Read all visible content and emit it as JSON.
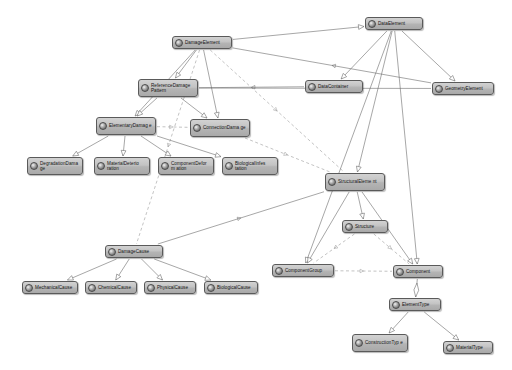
{
  "diagram": {
    "type": "uml-class-diagram",
    "background": "#ffffff",
    "node_fill": "#c3c3c3",
    "node_border": "#5a5a5a",
    "edge_color": "#6b6b6b",
    "dashed_edge_color": "#9a9a9a",
    "nodes": [
      {
        "id": "damageElement",
        "label": "DamageElement",
        "x": 172,
        "y": 36,
        "w": 60,
        "h": 13
      },
      {
        "id": "dataElement",
        "label": "DataElement",
        "x": 365,
        "y": 17,
        "w": 58,
        "h": 13
      },
      {
        "id": "referenceDamagePattern",
        "label": "ReferenceDamage Pattern",
        "x": 138,
        "y": 79,
        "w": 60,
        "h": 18
      },
      {
        "id": "dataContainer",
        "label": "DataContainer",
        "x": 305,
        "y": 80,
        "w": 58,
        "h": 13
      },
      {
        "id": "geometryElement",
        "label": "GeometryElement",
        "x": 432,
        "y": 82,
        "w": 62,
        "h": 13
      },
      {
        "id": "elementaryDamage",
        "label": "ElementaryDamag e",
        "x": 96,
        "y": 117,
        "w": 60,
        "h": 18
      },
      {
        "id": "connectionDamage",
        "label": "ConnectionDama ge",
        "x": 190,
        "y": 119,
        "w": 60,
        "h": 18
      },
      {
        "id": "degradationDamage",
        "label": "DegradationDama ge",
        "x": 27,
        "y": 157,
        "w": 56,
        "h": 18
      },
      {
        "id": "materialDeterioration",
        "label": "MaterialDeterio ration",
        "x": 94,
        "y": 157,
        "w": 56,
        "h": 18
      },
      {
        "id": "componentDeformation",
        "label": "ComponentDeform ation",
        "x": 158,
        "y": 157,
        "w": 56,
        "h": 18
      },
      {
        "id": "biologicalInfestation",
        "label": "BiologicalInfes tation",
        "x": 222,
        "y": 157,
        "w": 56,
        "h": 18
      },
      {
        "id": "structuralElement",
        "label": "StructuralEleme nt",
        "x": 325,
        "y": 173,
        "w": 60,
        "h": 18
      },
      {
        "id": "structure",
        "label": "Structure",
        "x": 342,
        "y": 220,
        "w": 46,
        "h": 13
      },
      {
        "id": "damageCause",
        "label": "DamageCause",
        "x": 105,
        "y": 245,
        "w": 58,
        "h": 13
      },
      {
        "id": "componentGroup",
        "label": "ComponentGroup",
        "x": 272,
        "y": 264,
        "w": 62,
        "h": 13
      },
      {
        "id": "component",
        "label": "Component",
        "x": 393,
        "y": 265,
        "w": 50,
        "h": 13
      },
      {
        "id": "mechanicalCause",
        "label": "MechanicalCause",
        "x": 22,
        "y": 281,
        "w": 56,
        "h": 13
      },
      {
        "id": "chemicalCause",
        "label": "ChemicalCause",
        "x": 85,
        "y": 281,
        "w": 52,
        "h": 13
      },
      {
        "id": "physicalCause",
        "label": "PhysicalCause",
        "x": 144,
        "y": 281,
        "w": 52,
        "h": 13
      },
      {
        "id": "biologicalCause",
        "label": "BiologicalCause",
        "x": 204,
        "y": 281,
        "w": 54,
        "h": 13
      },
      {
        "id": "elementType",
        "label": "ElementType",
        "x": 389,
        "y": 298,
        "w": 52,
        "h": 13
      },
      {
        "id": "constructionType",
        "label": "ConstructionTyp e",
        "x": 352,
        "y": 334,
        "w": 56,
        "h": 18
      },
      {
        "id": "materialType",
        "label": "MaterialType",
        "x": 443,
        "y": 341,
        "w": 50,
        "h": 13
      }
    ],
    "edges": [
      {
        "from": "damageElement",
        "to": "referenceDamagePattern",
        "style": "solid",
        "arrow": "hollow"
      },
      {
        "from": "damageElement",
        "to": "elementaryDamage",
        "style": "solid",
        "arrow": "hollow"
      },
      {
        "from": "damageElement",
        "to": "connectionDamage",
        "style": "solid",
        "arrow": "hollow"
      },
      {
        "from": "damageElement",
        "to": "dataElement",
        "style": "solid",
        "arrow": "hollow"
      },
      {
        "from": "damageElement",
        "to": "structuralElement",
        "style": "dashed",
        "arrow": "open"
      },
      {
        "from": "damageElement",
        "to": "damageCause",
        "style": "dashed",
        "arrow": "open"
      },
      {
        "from": "dataElement",
        "to": "dataContainer",
        "style": "solid",
        "arrow": "hollow"
      },
      {
        "from": "dataElement",
        "to": "geometryElement",
        "style": "solid",
        "arrow": "hollow"
      },
      {
        "from": "dataElement",
        "to": "structuralElement",
        "style": "solid",
        "arrow": "hollow"
      },
      {
        "from": "dataElement",
        "to": "component",
        "style": "solid",
        "arrow": "hollow"
      },
      {
        "from": "dataElement",
        "to": "componentGroup",
        "style": "solid",
        "arrow": "hollow"
      },
      {
        "from": "dataContainer",
        "to": "referenceDamagePattern",
        "style": "solid",
        "arrow": "open"
      },
      {
        "from": "geometryElement",
        "to": "damageElement",
        "style": "solid",
        "arrow": "open"
      },
      {
        "from": "referenceDamagePattern",
        "to": "elementaryDamage",
        "style": "solid",
        "arrow": "hollow"
      },
      {
        "from": "referenceDamagePattern",
        "to": "connectionDamage",
        "style": "solid",
        "arrow": "hollow"
      },
      {
        "from": "elementaryDamage",
        "to": "connectionDamage",
        "style": "dashed",
        "arrow": "open"
      },
      {
        "from": "elementaryDamage",
        "to": "degradationDamage",
        "style": "solid",
        "arrow": "hollow"
      },
      {
        "from": "elementaryDamage",
        "to": "materialDeterioration",
        "style": "solid",
        "arrow": "hollow"
      },
      {
        "from": "elementaryDamage",
        "to": "componentDeformation",
        "style": "solid",
        "arrow": "hollow"
      },
      {
        "from": "elementaryDamage",
        "to": "biologicalInfestation",
        "style": "solid",
        "arrow": "hollow"
      },
      {
        "from": "structuralElement",
        "to": "structure",
        "style": "solid",
        "arrow": "hollow"
      },
      {
        "from": "structuralElement",
        "to": "componentGroup",
        "style": "solid",
        "arrow": "hollow"
      },
      {
        "from": "structuralElement",
        "to": "component",
        "style": "solid",
        "arrow": "hollow"
      },
      {
        "from": "structure",
        "to": "componentGroup",
        "style": "dashed",
        "arrow": "open"
      },
      {
        "from": "structure",
        "to": "component",
        "style": "dashed",
        "arrow": "open"
      },
      {
        "from": "componentGroup",
        "to": "component",
        "style": "dashed",
        "arrow": "open"
      },
      {
        "from": "component",
        "to": "elementType",
        "style": "solid",
        "arrow": "diamond"
      },
      {
        "from": "elementType",
        "to": "constructionType",
        "style": "solid",
        "arrow": "hollow"
      },
      {
        "from": "elementType",
        "to": "materialType",
        "style": "solid",
        "arrow": "hollow"
      },
      {
        "from": "damageCause",
        "to": "mechanicalCause",
        "style": "solid",
        "arrow": "hollow"
      },
      {
        "from": "damageCause",
        "to": "chemicalCause",
        "style": "solid",
        "arrow": "hollow"
      },
      {
        "from": "damageCause",
        "to": "physicalCause",
        "style": "solid",
        "arrow": "hollow"
      },
      {
        "from": "damageCause",
        "to": "biologicalCause",
        "style": "solid",
        "arrow": "hollow"
      },
      {
        "from": "damageCause",
        "to": "structuralElement",
        "style": "solid",
        "arrow": "open"
      },
      {
        "from": "connectionDamage",
        "to": "structuralElement",
        "style": "dashed",
        "arrow": "open"
      },
      {
        "from": "referenceDamagePattern",
        "to": "geometryElement",
        "style": "solid",
        "arrow": "open"
      }
    ],
    "caption": ""
  }
}
